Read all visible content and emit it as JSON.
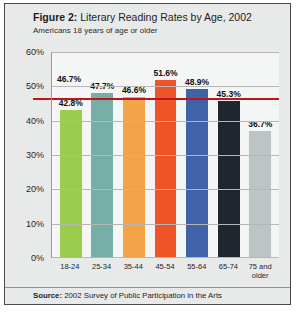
{
  "figure": {
    "title_lead": "Figure 2:",
    "title_rest": " Literary Reading Rates by Age, 2002",
    "subtitle": "Americans 18 years of age or older",
    "source_lead": "Source:",
    "source_rest": " 2002 Survey of Public Participation in the Arts"
  },
  "chart_data": {
    "type": "bar",
    "title": "Figure 2: Literary Reading Rates by Age, 2002",
    "subtitle": "Americans 18 years of age or older",
    "xlabel": "",
    "ylabel": "",
    "ylim": [
      0,
      60
    ],
    "ytick_labels": [
      "60%",
      "50%",
      "40%",
      "30%",
      "20%",
      "10%",
      "0%"
    ],
    "ytick_values": [
      60,
      50,
      40,
      30,
      20,
      10,
      0
    ],
    "grid": true,
    "legend": "none",
    "categories": [
      "18-24",
      "25-34",
      "35-44",
      "45-54",
      "55-64",
      "65-74",
      "75 and older"
    ],
    "values": [
      42.8,
      47.7,
      46.6,
      51.6,
      48.9,
      45.3,
      36.7
    ],
    "value_labels": [
      "42.8%",
      "47.7%",
      "46.6%",
      "51.6%",
      "48.9%",
      "45.3%",
      "36.7%"
    ],
    "colors": [
      "#9ACD4E",
      "#76AFA8",
      "#F3A448",
      "#EE5428",
      "#3F62A8",
      "#20262E",
      "#BCC4C6"
    ],
    "reference_line": {
      "value": 46.7,
      "label": "46.7%",
      "color": "#C0141B"
    },
    "source": "Source: 2002 Survey of Public Participation in the Arts"
  }
}
